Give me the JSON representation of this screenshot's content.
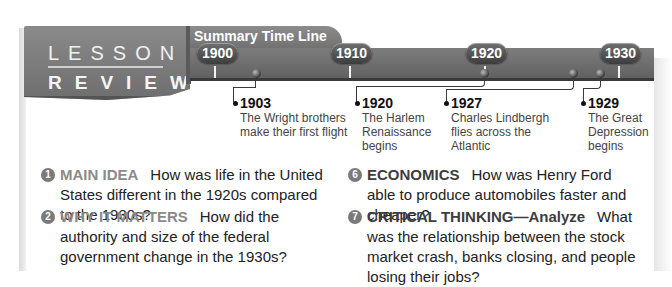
{
  "lesson": {
    "title": "LESSON 4",
    "subtitle": "REVIEW"
  },
  "timeline": {
    "label": "Summary Time Line",
    "years": [
      "1900",
      "1910",
      "1920",
      "1930"
    ],
    "events": [
      {
        "year": "1903",
        "text": "The Wright brothers make their first flight"
      },
      {
        "year": "1920",
        "text": "The Harlem Renaissance begins"
      },
      {
        "year": "1927",
        "text": "Charles Lindbergh flies across the Atlantic"
      },
      {
        "year": "1929",
        "text": "The Great Depression begins"
      }
    ]
  },
  "questions": [
    {
      "number": "1",
      "category": "MAIN IDEA",
      "text": "How was life in the United States different in the 1920s compared to the 1930s?"
    },
    {
      "number": "2",
      "category": "WHY IT MATTERS",
      "text": "How did the authority and size of the federal government change in the 1930s?"
    },
    {
      "number": "6",
      "category": "ECONOMICS",
      "text": "How was Henry Ford able to produce automobiles faster and cheaper?"
    },
    {
      "number": "7",
      "category": "CRITICAL THINKING—Analyze",
      "text": "What was the relationship between the stock market crash, banks closing, and people losing their jobs?"
    }
  ],
  "colors": {
    "banner_gray": "#7a7a7a",
    "category_light": "#8a8a8a",
    "category_dark": "#3d3d3d",
    "body_text": "#222222"
  }
}
